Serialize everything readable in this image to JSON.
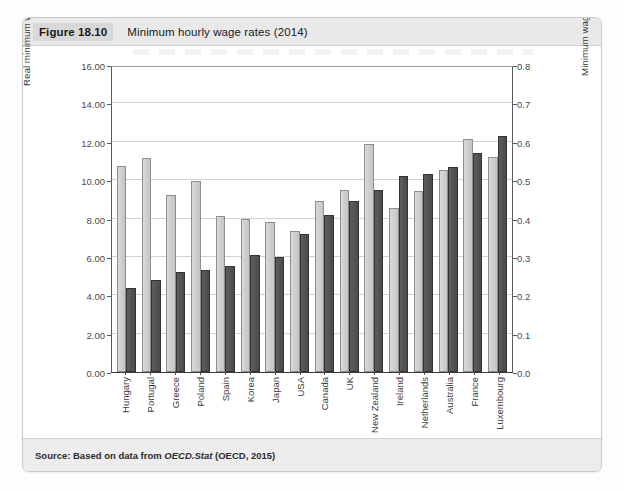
{
  "figure": {
    "number": "Figure 18.10",
    "title": "Minimum hourly wage rates (2014)",
    "source_prefix": "Source: Based on data from ",
    "source_italic": "OECD.Stat",
    "source_suffix": " (OECD, 2015)"
  },
  "chart_data": {
    "type": "bar",
    "title": "Minimum hourly wage rates (2014)",
    "xlabel": "",
    "ylabel": "Real minimum wage ($ at 2014 prices PPPs)",
    "y2label": "Minimum wage as percentage of median wage",
    "ylim": [
      0.0,
      16.0
    ],
    "y2lim": [
      0.0,
      0.8
    ],
    "yticks": [
      "0.00",
      "2.00",
      "4.00",
      "6.00",
      "8.00",
      "10.00",
      "12.00",
      "14.00",
      "16.00"
    ],
    "y2ticks": [
      "0.0",
      "0.1",
      "0.2",
      "0.3",
      "0.4",
      "0.5",
      "0.6",
      "0.7",
      "0.8"
    ],
    "grid": true,
    "legend": "none",
    "categories": [
      "Hungary",
      "Portugal",
      "Greece",
      "Poland",
      "Spain",
      "Korea",
      "Japan",
      "USA",
      "Canada",
      "UK",
      "New Zealand",
      "Ireland",
      "Netherlands",
      "Australia",
      "France",
      "Luxembourg"
    ],
    "series": [
      {
        "name": "Real minimum wage ($ at 2014 prices PPPs)",
        "axis": "left",
        "color": "#c9c9c9",
        "values": [
          10.75,
          11.15,
          9.2,
          9.95,
          8.15,
          7.95,
          7.8,
          7.35,
          8.9,
          9.5,
          11.9,
          8.55,
          9.45,
          10.55,
          12.15,
          11.2
        ]
      },
      {
        "name": "Minimum wage as percentage of median wage",
        "axis": "right",
        "color": "#505050",
        "values": [
          0.22,
          0.24,
          0.26,
          0.265,
          0.275,
          0.305,
          0.3,
          0.36,
          0.41,
          0.445,
          0.475,
          0.51,
          0.515,
          0.535,
          0.57,
          0.615
        ]
      }
    ]
  }
}
